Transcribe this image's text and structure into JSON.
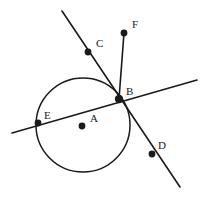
{
  "figure": {
    "type": "geometry-diagram",
    "width": 202,
    "height": 200,
    "background_color": "#ffffff",
    "stroke_color": "#1a1a1a",
    "label_color": "#1a1a1a",
    "line_width": 1.6,
    "circle_stroke_width": 1.5,
    "dot_radius": 3.4,
    "intersection_dot_radius": 4.2
  },
  "circle": {
    "name": "circle-A",
    "center_x": 83,
    "center_y": 125,
    "radius": 47
  },
  "points": [
    {
      "id": "A",
      "label": "A",
      "cx": 82,
      "cy": 126,
      "label_x": 90,
      "label_y": 122,
      "role": "circle-center"
    },
    {
      "id": "B",
      "label": "B",
      "cx": 119,
      "cy": 99,
      "label_x": 126,
      "label_y": 95,
      "role": "intersection-on-circle"
    },
    {
      "id": "C",
      "label": "C",
      "cx": 88,
      "cy": 52,
      "label_x": 96,
      "label_y": 47,
      "role": "point-on-line-cbd"
    },
    {
      "id": "D",
      "label": "D",
      "cx": 152,
      "cy": 154,
      "label_x": 158,
      "label_y": 149,
      "role": "point-on-line-cbd"
    },
    {
      "id": "E",
      "label": "E",
      "cx": 38,
      "cy": 123,
      "label_x": 44,
      "label_y": 119,
      "role": "point-on-circle-secant"
    },
    {
      "id": "F",
      "label": "F",
      "cx": 124,
      "cy": 33,
      "label_x": 132,
      "label_y": 28,
      "role": "segment-endpoint"
    }
  ],
  "lines": [
    {
      "id": "secant-EB",
      "name": "secant-line-through-E-and-B",
      "x1": 12,
      "y1": 133,
      "x2": 197,
      "y2": 80
    },
    {
      "id": "line-CBD",
      "name": "line-through-C-B-D",
      "x1": 62,
      "y1": 11,
      "x2": 180,
      "y2": 187
    },
    {
      "id": "segment-FB",
      "name": "segment-F-to-B",
      "x1": 124,
      "y1": 33,
      "x2": 119,
      "y2": 99
    }
  ]
}
